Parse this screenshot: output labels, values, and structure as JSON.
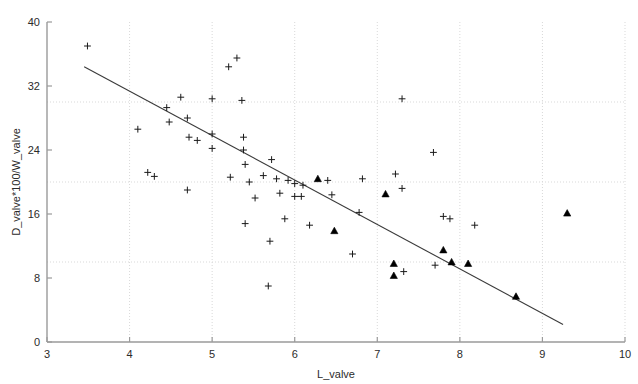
{
  "chart_data": {
    "type": "scatter",
    "title": "",
    "xlabel": "L_valve",
    "ylabel": "D_valve*100/W_valve",
    "xlim": [
      3,
      10
    ],
    "ylim": [
      0,
      40
    ],
    "xticks": [
      3,
      4,
      5,
      6,
      7,
      8,
      9,
      10
    ],
    "yticks": [
      0,
      8,
      16,
      24,
      32,
      40
    ],
    "grid": true,
    "gridlines_y": [
      10,
      20,
      30
    ],
    "gridlines_x": [
      4,
      5,
      6,
      7,
      8,
      9,
      10
    ],
    "legend": null,
    "marker_colors": {
      "plus": "#1a1a1a",
      "triangle": "#000000",
      "trendline": "#3a3a3a",
      "axis": "#9a9a9a",
      "grid": "#d9d9d9"
    },
    "series": [
      {
        "name": "plus",
        "marker": "plus",
        "points": [
          [
            3.49,
            37.0
          ],
          [
            4.1,
            26.6
          ],
          [
            4.22,
            21.2
          ],
          [
            4.3,
            20.7
          ],
          [
            4.45,
            29.3
          ],
          [
            4.48,
            27.5
          ],
          [
            4.62,
            30.6
          ],
          [
            4.7,
            28.0
          ],
          [
            4.7,
            19.0
          ],
          [
            4.72,
            25.6
          ],
          [
            4.82,
            25.2
          ],
          [
            5.0,
            30.4
          ],
          [
            5.0,
            24.2
          ],
          [
            5.0,
            26.0
          ],
          [
            5.2,
            34.4
          ],
          [
            5.22,
            20.6
          ],
          [
            5.3,
            35.5
          ],
          [
            5.36,
            30.2
          ],
          [
            5.38,
            25.6
          ],
          [
            5.38,
            24.0
          ],
          [
            5.4,
            22.2
          ],
          [
            5.4,
            14.8
          ],
          [
            5.45,
            20.0
          ],
          [
            5.52,
            18.0
          ],
          [
            5.62,
            20.8
          ],
          [
            5.68,
            7.0
          ],
          [
            5.7,
            12.6
          ],
          [
            5.72,
            22.8
          ],
          [
            5.78,
            20.4
          ],
          [
            5.82,
            18.6
          ],
          [
            5.88,
            15.4
          ],
          [
            5.92,
            20.2
          ],
          [
            6.0,
            18.2
          ],
          [
            6.0,
            19.8
          ],
          [
            6.08,
            18.2
          ],
          [
            6.1,
            19.6
          ],
          [
            6.18,
            14.6
          ],
          [
            6.4,
            20.2
          ],
          [
            6.45,
            18.4
          ],
          [
            6.7,
            11.0
          ],
          [
            6.78,
            16.2
          ],
          [
            6.82,
            20.4
          ],
          [
            7.22,
            21.0
          ],
          [
            7.3,
            19.2
          ],
          [
            7.3,
            30.4
          ],
          [
            7.32,
            8.8
          ],
          [
            7.68,
            23.7
          ],
          [
            7.7,
            9.6
          ],
          [
            7.8,
            15.7
          ],
          [
            7.88,
            15.4
          ],
          [
            8.18,
            14.6
          ]
        ]
      },
      {
        "name": "triangle",
        "marker": "triangle",
        "points": [
          [
            6.28,
            20.4
          ],
          [
            6.48,
            13.9
          ],
          [
            7.1,
            18.5
          ],
          [
            7.2,
            9.8
          ],
          [
            7.2,
            8.3
          ],
          [
            7.8,
            11.5
          ],
          [
            7.9,
            10.0
          ],
          [
            8.1,
            9.8
          ],
          [
            8.68,
            5.7
          ],
          [
            9.3,
            16.1
          ]
        ]
      }
    ],
    "trendline": {
      "name": "regression-line",
      "x0": 3.45,
      "y0": 34.4,
      "x1": 9.25,
      "y1": 2.2
    }
  }
}
